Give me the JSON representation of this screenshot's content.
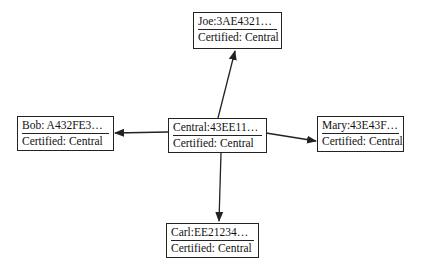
{
  "diagram": {
    "type": "certificate-trust-graph",
    "center": "central",
    "nodes": [
      {
        "id": "joe",
        "title": "Joe:3AE4321…",
        "subtitle": "Certified: Central",
        "x": 193,
        "y": 12,
        "w": 89,
        "h": 37
      },
      {
        "id": "bob",
        "title": "Bob: A432FE3…",
        "subtitle": "Certified: Central",
        "x": 17,
        "y": 116,
        "w": 97,
        "h": 35
      },
      {
        "id": "central",
        "title": "Central:43EE11…",
        "subtitle": "Certified: Central",
        "x": 168,
        "y": 118,
        "w": 99,
        "h": 35
      },
      {
        "id": "mary",
        "title": "Mary:43E43F…",
        "subtitle": "Certified: Central",
        "x": 317,
        "y": 116,
        "w": 87,
        "h": 36
      },
      {
        "id": "carl",
        "title": "Carl:EE21234…",
        "subtitle": "Certified: Central",
        "x": 166,
        "y": 223,
        "w": 93,
        "h": 35
      }
    ],
    "edges": [
      {
        "from": "central",
        "to": "joe",
        "x1": 218,
        "y1": 118,
        "x2": 235,
        "y2": 51
      },
      {
        "from": "central",
        "to": "bob",
        "x1": 168,
        "y1": 132,
        "x2": 115,
        "y2": 133
      },
      {
        "from": "central",
        "to": "mary",
        "x1": 266,
        "y1": 133,
        "x2": 316,
        "y2": 141
      },
      {
        "from": "central",
        "to": "carl",
        "x1": 221,
        "y1": 153,
        "x2": 219,
        "y2": 221
      }
    ],
    "colors": {
      "stroke": "#222222",
      "text": "#111111",
      "background": "#ffffff"
    }
  }
}
